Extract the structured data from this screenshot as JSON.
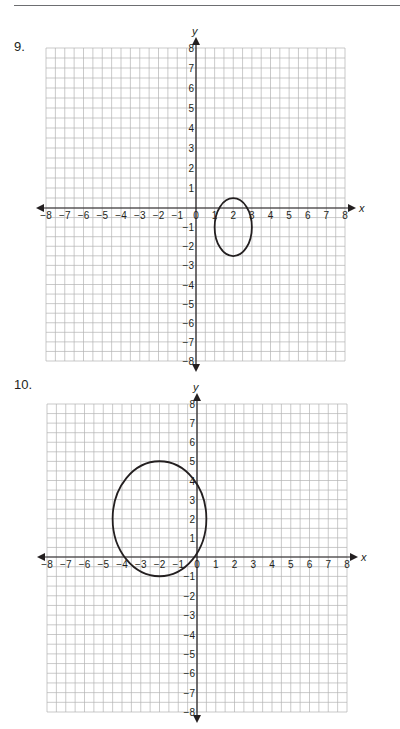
{
  "page": {
    "top_rule": true,
    "problems": [
      {
        "number": "9."
      },
      {
        "number": "10."
      }
    ]
  },
  "chart_data": [
    {
      "type": "scatter",
      "title": "9.",
      "xlabel": "x",
      "ylabel": "y",
      "xlim": [
        -8,
        8
      ],
      "ylim": [
        -8,
        8
      ],
      "grid": true,
      "grid_step": 0.5,
      "x_ticks": [
        "-8",
        "-7",
        "-6",
        "-5",
        "-4",
        "-3",
        "-2",
        "-1",
        "0",
        "1",
        "2",
        "3",
        "4",
        "5",
        "6",
        "7",
        "8"
      ],
      "y_ticks": [
        "8",
        "7",
        "6",
        "5",
        "4",
        "3",
        "2",
        "1",
        "-1",
        "-2",
        "-3",
        "-4",
        "-5",
        "-6",
        "-7",
        "-8"
      ],
      "shape": {
        "kind": "ellipse",
        "center": [
          2,
          -1
        ],
        "rx": 1,
        "ry": 1.5
      },
      "extents": {
        "left": 1,
        "right": 3,
        "top": 0.5,
        "bottom": -2.5
      },
      "legend": null
    },
    {
      "type": "scatter",
      "title": "10.",
      "xlabel": "x",
      "ylabel": "y",
      "xlim": [
        -8,
        8
      ],
      "ylim": [
        -8,
        8
      ],
      "grid": true,
      "grid_step": 0.5,
      "x_ticks": [
        "-8",
        "-7",
        "-6",
        "-5",
        "-4",
        "-3",
        "-2",
        "-1",
        "0",
        "1",
        "2",
        "3",
        "4",
        "5",
        "6",
        "7",
        "8"
      ],
      "y_ticks": [
        "8",
        "7",
        "6",
        "5",
        "4",
        "3",
        "2",
        "1",
        "-1",
        "-2",
        "-3",
        "-4",
        "-5",
        "-6",
        "-7",
        "-8"
      ],
      "shape": {
        "kind": "ellipse",
        "center": [
          -2,
          2
        ],
        "rx": 2.5,
        "ry": 3
      },
      "extents": {
        "left": -4.5,
        "right": 0.5,
        "top": 5,
        "bottom": -1
      },
      "legend": null
    }
  ],
  "colors": {
    "grid": "#b3b3b3",
    "axis": "#231f20",
    "curve": "#231f20",
    "text": "#231f20"
  }
}
